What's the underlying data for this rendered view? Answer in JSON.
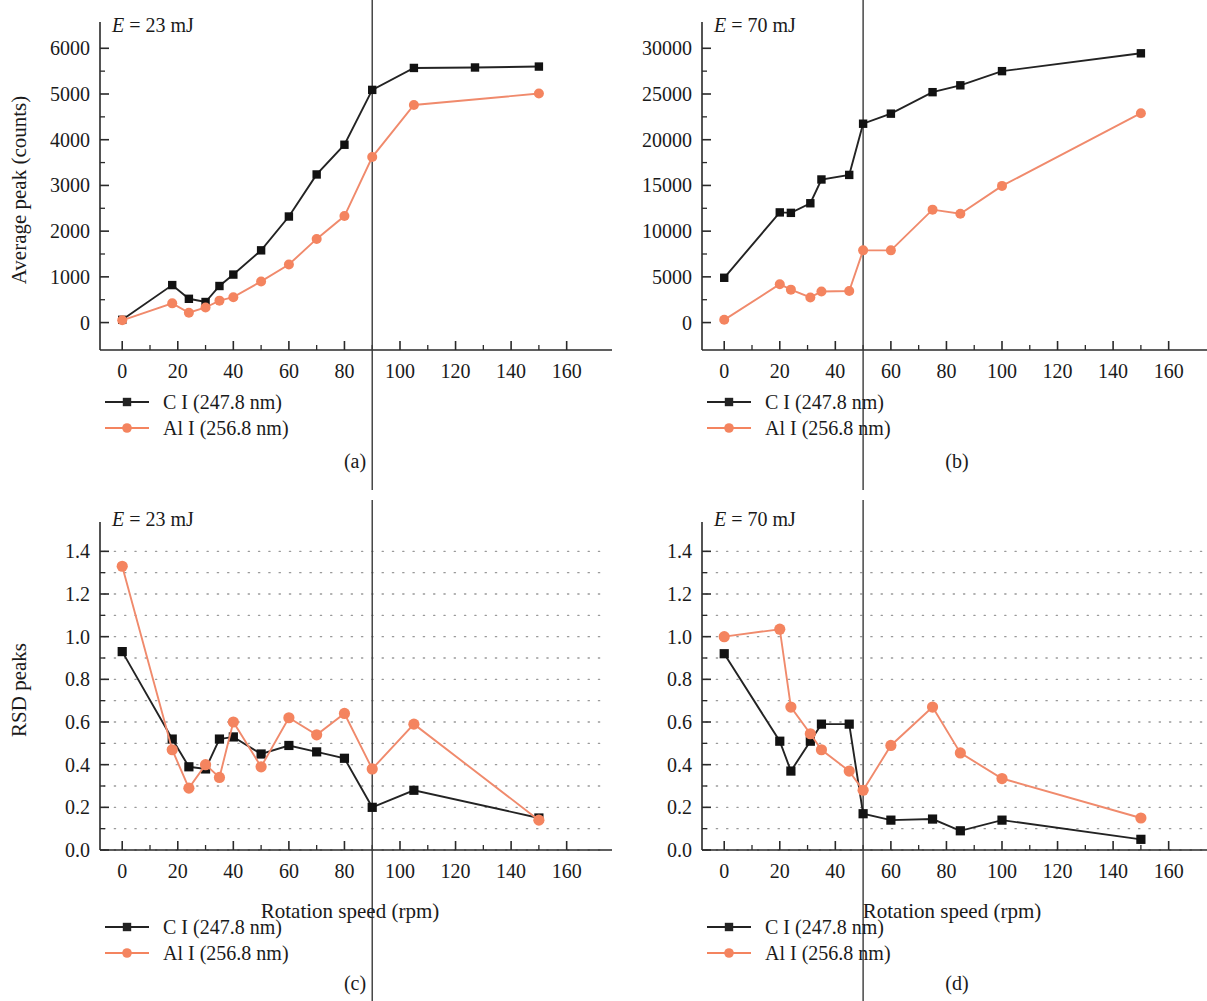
{
  "figure": {
    "series_names": {
      "c": "C I (247.8 nm)",
      "al": "Al I (256.8 nm)"
    },
    "xlabel": "Rotation speed (rpm)",
    "ylabel_top": "Average peak (counts)",
    "ylabel_bottom": "RSD peaks",
    "colors": {
      "c_line": "#232323",
      "al_line": "#f4845f",
      "axis": "#2a2a2a",
      "grid": "#999999",
      "vline": "#3a3a3a"
    }
  },
  "chart_data": [
    {
      "type": "line",
      "panel": "a",
      "caption": "(a)",
      "annotation": "E = 23 mJ",
      "annotation_italic_prefix": "E",
      "annotation_rest": " = 23 mJ",
      "title": "",
      "xlabel": "",
      "ylabel": "Average peak (counts)",
      "xlim": [
        -8,
        172
      ],
      "ylim": [
        -600,
        6400
      ],
      "xticks": [
        0,
        20,
        40,
        60,
        80,
        100,
        120,
        140,
        160
      ],
      "yticks": [
        0,
        1000,
        2000,
        3000,
        4000,
        5000,
        6000
      ],
      "xminor_step": 10,
      "yminor_step": 500,
      "grid": false,
      "vline_x": 90,
      "legend_position": "below-left",
      "series": [
        {
          "name": "C I (247.8 nm)",
          "marker": "square",
          "color": "#232323",
          "x": [
            0,
            18,
            24,
            30,
            35,
            40,
            50,
            60,
            70,
            80,
            90,
            105,
            127,
            150
          ],
          "values": [
            60,
            820,
            520,
            450,
            800,
            1050,
            1580,
            2320,
            3240,
            3890,
            5090,
            5570,
            5580,
            5600
          ]
        },
        {
          "name": "Al I (256.8 nm)",
          "marker": "circle",
          "color": "#f4845f",
          "x": [
            0,
            18,
            24,
            30,
            35,
            40,
            50,
            60,
            70,
            80,
            90,
            105,
            150
          ],
          "values": [
            50,
            420,
            215,
            330,
            480,
            555,
            900,
            1270,
            1830,
            2330,
            3620,
            4760,
            5010
          ]
        }
      ]
    },
    {
      "type": "line",
      "panel": "b",
      "caption": "(b)",
      "annotation": "E = 70 mJ",
      "annotation_italic_prefix": "E",
      "annotation_rest": " = 70 mJ",
      "title": "",
      "xlabel": "",
      "ylabel": "",
      "xlim": [
        -8,
        172
      ],
      "ylim": [
        -3000,
        32000
      ],
      "xticks": [
        0,
        20,
        40,
        60,
        80,
        100,
        120,
        140,
        160
      ],
      "yticks": [
        0,
        5000,
        10000,
        15000,
        20000,
        25000,
        30000
      ],
      "xminor_step": 10,
      "yminor_step": 2500,
      "grid": false,
      "vline_x": 50,
      "legend_position": "below-left",
      "series": [
        {
          "name": "C I (247.8 nm)",
          "marker": "square",
          "color": "#232323",
          "x": [
            0,
            20,
            24,
            31,
            35,
            45,
            50,
            60,
            75,
            85,
            100,
            150
          ],
          "values": [
            4900,
            12050,
            12000,
            13050,
            15650,
            16150,
            21750,
            22850,
            25200,
            25950,
            27500,
            29450
          ]
        },
        {
          "name": "Al I (256.8 nm)",
          "marker": "circle",
          "color": "#f4845f",
          "x": [
            0,
            20,
            24,
            31,
            35,
            45,
            50,
            60,
            75,
            85,
            100,
            150
          ],
          "values": [
            300,
            4200,
            3600,
            2750,
            3400,
            3450,
            7900,
            7900,
            12350,
            11900,
            14950,
            22900
          ]
        }
      ]
    },
    {
      "type": "line",
      "panel": "c",
      "caption": "(c)",
      "annotation": "E = 23 mJ",
      "annotation_italic_prefix": "E",
      "annotation_rest": " = 23 mJ",
      "title": "",
      "xlabel": "Rotation speed (rpm)",
      "ylabel": "RSD peaks",
      "xlim": [
        -8,
        172
      ],
      "ylim": [
        0.0,
        1.5
      ],
      "xticks": [
        0,
        20,
        40,
        60,
        80,
        100,
        120,
        140,
        160
      ],
      "yticks": [
        0.0,
        0.2,
        0.4,
        0.6,
        0.8,
        1.0,
        1.2,
        1.4
      ],
      "xminor_step": 10,
      "yminor_step": 0.1,
      "grid": true,
      "grid_style": "dotted",
      "vline_x": 90,
      "legend_position": "below-left",
      "series": [
        {
          "name": "C I (247.8 nm)",
          "marker": "square",
          "color": "#232323",
          "x": [
            0,
            18,
            24,
            30,
            35,
            40,
            50,
            60,
            70,
            80,
            90,
            105,
            150
          ],
          "values": [
            0.93,
            0.52,
            0.39,
            0.38,
            0.52,
            0.53,
            0.45,
            0.49,
            0.46,
            0.43,
            0.2,
            0.28,
            0.15
          ]
        },
        {
          "name": "Al I (256.8 nm)",
          "marker": "circle",
          "color": "#f4845f",
          "x": [
            0,
            18,
            24,
            30,
            35,
            40,
            50,
            60,
            70,
            80,
            90,
            105,
            150
          ],
          "values": [
            1.33,
            0.47,
            0.29,
            0.4,
            0.34,
            0.6,
            0.39,
            0.62,
            0.54,
            0.64,
            0.38,
            0.59,
            0.14
          ]
        }
      ]
    },
    {
      "type": "line",
      "panel": "d",
      "caption": "(d)",
      "annotation": "E = 70 mJ",
      "annotation_italic_prefix": "E",
      "annotation_rest": " = 70 mJ",
      "title": "",
      "xlabel": "Rotation speed (rpm)",
      "ylabel": "",
      "xlim": [
        -8,
        172
      ],
      "ylim": [
        0.0,
        1.5
      ],
      "xticks": [
        0,
        20,
        40,
        60,
        80,
        100,
        120,
        140,
        160
      ],
      "yticks": [
        0.0,
        0.2,
        0.4,
        0.6,
        0.8,
        1.0,
        1.2,
        1.4
      ],
      "xminor_step": 10,
      "yminor_step": 0.1,
      "grid": true,
      "grid_style": "dotted",
      "vline_x": 50,
      "legend_position": "below-left",
      "series": [
        {
          "name": "C I (247.8 nm)",
          "marker": "square",
          "color": "#232323",
          "x": [
            0,
            20,
            24,
            31,
            35,
            45,
            50,
            60,
            75,
            85,
            100,
            150
          ],
          "values": [
            0.92,
            0.51,
            0.37,
            0.51,
            0.59,
            0.59,
            0.17,
            0.14,
            0.145,
            0.09,
            0.14,
            0.05
          ]
        },
        {
          "name": "Al I (256.8 nm)",
          "marker": "circle",
          "color": "#f4845f",
          "x": [
            0,
            20,
            24,
            31,
            35,
            45,
            50,
            60,
            75,
            85,
            100,
            150
          ],
          "values": [
            1.0,
            1.035,
            0.67,
            0.545,
            0.47,
            0.37,
            0.28,
            0.49,
            0.67,
            0.455,
            0.335,
            0.15
          ]
        }
      ]
    }
  ]
}
